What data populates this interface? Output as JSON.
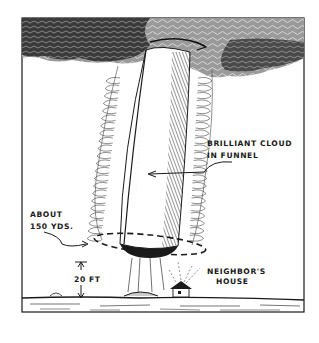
{
  "figure": {
    "labels": {
      "cloud_line1": "BRILLIANT CLOUD",
      "cloud_line2": "IN FUNNEL",
      "width_line1": "ABOUT",
      "width_line2": "150 YDS.",
      "height": "20 FT",
      "house_line1": "NEIGHBOR'S",
      "house_line2": "HOUSE"
    },
    "colors": {
      "ink": "#1a1a1a",
      "paper": "#ffffff"
    }
  }
}
